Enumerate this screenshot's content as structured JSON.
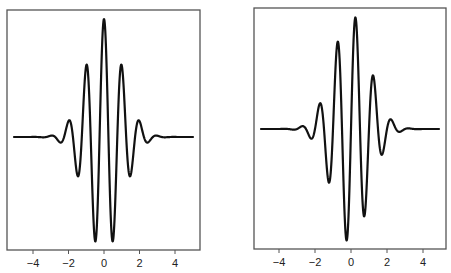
{
  "chart_data": [
    {
      "type": "line",
      "title": "",
      "xlabel": "",
      "ylabel": "",
      "description": "Real part of Morlet wavelet: cos(2*pi*x) * exp(-x^2/2)",
      "xlim": [
        -5,
        5
      ],
      "ylim": [
        -1.1,
        1.1
      ],
      "grid": false,
      "legend": null,
      "x_ticks": [
        -4,
        -2,
        0,
        2,
        4
      ],
      "x_tick_labels": [
        "−4",
        "−2",
        "0",
        "2",
        "4"
      ],
      "y_ticks": [],
      "function": "cos",
      "frequency": 1.0,
      "amplitude": 1.0,
      "series": [
        {
          "name": "real part",
          "x": [
            -5,
            -4,
            -3,
            -2.5,
            -2,
            -1.5,
            -1,
            -0.5,
            0,
            0.5,
            1,
            1.5,
            2,
            2.5,
            3,
            4,
            5
          ],
          "values": [
            0,
            0,
            0.01,
            -0.04,
            0.14,
            -0.32,
            0.61,
            -0.88,
            1.0,
            -0.88,
            0.61,
            -0.32,
            0.14,
            -0.04,
            0.01,
            0,
            0
          ]
        }
      ],
      "panel": {
        "left": 7,
        "top": 10,
        "right": 200,
        "bottom": 250,
        "x0_px": 104,
        "px_per_unit": 17.75,
        "baseline_y": 137,
        "amp_px": 118,
        "xrange_px": [
          14,
          193
        ]
      }
    },
    {
      "type": "line",
      "title": "",
      "xlabel": "",
      "ylabel": "",
      "description": "Imaginary part of Morlet wavelet: sin(2*pi*x) * exp(-x^2/2)",
      "xlim": [
        -5,
        5
      ],
      "ylim": [
        -1.1,
        1.1
      ],
      "grid": false,
      "legend": null,
      "x_ticks": [
        -4,
        -2,
        0,
        2,
        4
      ],
      "x_tick_labels": [
        "−4",
        "−2",
        "0",
        "2",
        "4"
      ],
      "y_ticks": [],
      "function": "sin",
      "frequency": 1.0,
      "amplitude": 1.0,
      "series": [
        {
          "name": "imaginary part",
          "x": [
            -5,
            -4,
            -2.75,
            -2.25,
            -1.75,
            -1.25,
            -0.75,
            -0.25,
            0,
            0.25,
            0.75,
            1.25,
            1.75,
            2.25,
            2.75,
            4,
            5
          ],
          "values": [
            0,
            0,
            0.02,
            -0.08,
            0.22,
            -0.46,
            0.75,
            -0.97,
            0,
            0.97,
            -0.75,
            0.46,
            -0.22,
            0.08,
            -0.02,
            0,
            0
          ]
        }
      ],
      "panel": {
        "left": 254,
        "top": 8,
        "right": 446,
        "bottom": 249,
        "x0_px": 351,
        "px_per_unit": 18,
        "baseline_y": 129,
        "amp_px": 115,
        "xrange_px": [
          261,
          439
        ]
      }
    }
  ]
}
